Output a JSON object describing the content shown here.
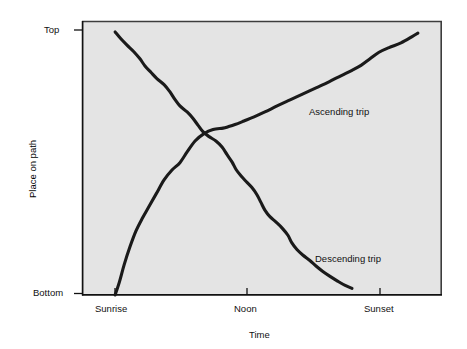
{
  "chart_data": {
    "type": "line",
    "title": "",
    "xlabel": "Time",
    "ylabel": "Place on path",
    "grid": false,
    "legend_position": "inline-annotation",
    "background": "#e4e4e4",
    "line_color": "#1a1a1a",
    "xlim": [
      0,
      1
    ],
    "ylim": [
      0,
      1
    ],
    "x_tick_labels": [
      "Sunrise",
      "Noon",
      "Sunset"
    ],
    "x_tick_values": [
      0.092,
      0.458,
      0.828
    ],
    "y_tick_labels": [
      "Bottom",
      "Top"
    ],
    "y_tick_values": [
      0.0,
      0.965
    ],
    "series": [
      {
        "name": "Ascending trip",
        "annotation": "Ascending trip",
        "points": [
          [
            0.092,
            0.0
          ],
          [
            0.104,
            0.048
          ],
          [
            0.117,
            0.11
          ],
          [
            0.133,
            0.175
          ],
          [
            0.15,
            0.234
          ],
          [
            0.168,
            0.281
          ],
          [
            0.186,
            0.323
          ],
          [
            0.206,
            0.369
          ],
          [
            0.228,
            0.42
          ],
          [
            0.25,
            0.456
          ],
          [
            0.272,
            0.483
          ],
          [
            0.292,
            0.522
          ],
          [
            0.314,
            0.562
          ],
          [
            0.339,
            0.589
          ],
          [
            0.364,
            0.604
          ],
          [
            0.392,
            0.609
          ],
          [
            0.406,
            0.614
          ],
          [
            0.425,
            0.622
          ],
          [
            0.45,
            0.635
          ],
          [
            0.478,
            0.65
          ],
          [
            0.508,
            0.668
          ],
          [
            0.542,
            0.69
          ],
          [
            0.578,
            0.712
          ],
          [
            0.614,
            0.734
          ],
          [
            0.65,
            0.756
          ],
          [
            0.686,
            0.778
          ],
          [
            0.719,
            0.8
          ],
          [
            0.75,
            0.82
          ],
          [
            0.775,
            0.838
          ],
          [
            0.8,
            0.862
          ],
          [
            0.825,
            0.886
          ],
          [
            0.853,
            0.903
          ],
          [
            0.886,
            0.92
          ],
          [
            0.917,
            0.943
          ],
          [
            0.933,
            0.956
          ]
        ]
      },
      {
        "name": "Descending trip",
        "annotation": "Descending trip",
        "points": [
          [
            0.092,
            0.96
          ],
          [
            0.108,
            0.935
          ],
          [
            0.125,
            0.912
          ],
          [
            0.144,
            0.888
          ],
          [
            0.161,
            0.862
          ],
          [
            0.175,
            0.836
          ],
          [
            0.192,
            0.812
          ],
          [
            0.208,
            0.79
          ],
          [
            0.228,
            0.768
          ],
          [
            0.244,
            0.742
          ],
          [
            0.258,
            0.714
          ],
          [
            0.272,
            0.69
          ],
          [
            0.292,
            0.668
          ],
          [
            0.308,
            0.645
          ],
          [
            0.322,
            0.62
          ],
          [
            0.336,
            0.596
          ],
          [
            0.353,
            0.578
          ],
          [
            0.372,
            0.562
          ],
          [
            0.389,
            0.54
          ],
          [
            0.403,
            0.512
          ],
          [
            0.417,
            0.485
          ],
          [
            0.428,
            0.458
          ],
          [
            0.442,
            0.434
          ],
          [
            0.456,
            0.414
          ],
          [
            0.472,
            0.392
          ],
          [
            0.486,
            0.366
          ],
          [
            0.497,
            0.338
          ],
          [
            0.508,
            0.31
          ],
          [
            0.522,
            0.286
          ],
          [
            0.539,
            0.266
          ],
          [
            0.556,
            0.244
          ],
          [
            0.572,
            0.218
          ],
          [
            0.583,
            0.19
          ],
          [
            0.597,
            0.166
          ],
          [
            0.614,
            0.145
          ],
          [
            0.633,
            0.126
          ],
          [
            0.65,
            0.106
          ],
          [
            0.669,
            0.086
          ],
          [
            0.689,
            0.068
          ],
          [
            0.711,
            0.05
          ],
          [
            0.731,
            0.035
          ],
          [
            0.75,
            0.024
          ]
        ]
      }
    ],
    "annotations": [
      {
        "text": "Ascending trip",
        "x": 0.636,
        "y": 0.672
      },
      {
        "text": "Descending trip",
        "x": 0.652,
        "y": 0.14
      }
    ]
  }
}
